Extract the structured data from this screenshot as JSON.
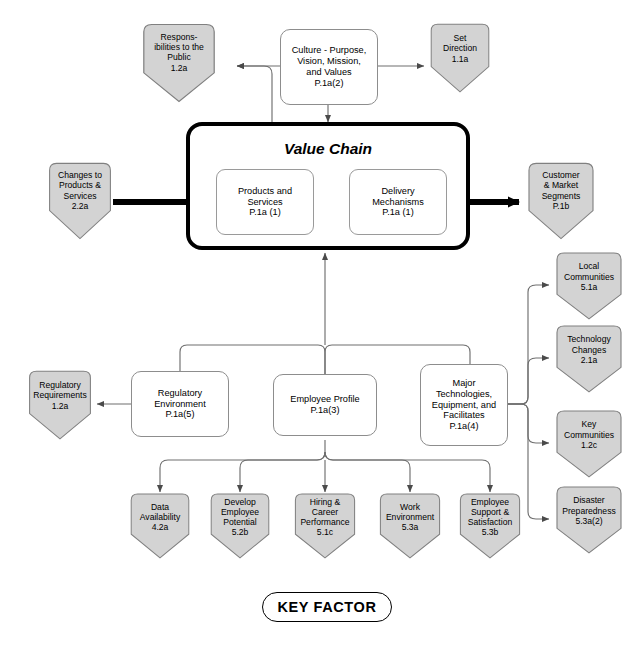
{
  "diagram": {
    "title": "Value Chain",
    "legend_label": "KEY FACTOR",
    "colors": {
      "pentagon_fill": "#d3d3d3",
      "pentagon_stroke": "#808080",
      "box_stroke": "#8d8d8d",
      "heavy_stroke": "#000000",
      "connector": "#6f6f6f",
      "background": "#ffffff"
    }
  },
  "value_chain": {
    "title": "Value Chain",
    "steps": [
      {
        "id": "products-and-services",
        "label": "Products and\nServices\nP.1a (1)"
      },
      {
        "id": "delivery-mechanisms",
        "label": "Delivery\nMechanisms\nP.1a (1)"
      }
    ]
  },
  "process_boxes": [
    {
      "id": "culture",
      "label": "Culture - Purpose,\nVision, Mission,\nand Values\nP.1a(2)"
    },
    {
      "id": "regulatory-environment",
      "label": "Regulatory\nEnvironment\nP.1a(5)"
    },
    {
      "id": "employee-profile",
      "label": "Employee Profile\nP.1a(3)"
    },
    {
      "id": "major-technologies",
      "label": "Major\nTechnologies,\nEquipment, and\nFacilitates\nP.1a(4)"
    }
  ],
  "key_factors": [
    {
      "id": "responsibilities-to-the-public",
      "label": "Respons-\nibilities to the\nPublic\n1.2a"
    },
    {
      "id": "set-direction",
      "label": "Set\nDirection\n1.1a"
    },
    {
      "id": "changes-to-products-and-services",
      "label": "Changes to\nProducts &\nServices\n2.2a"
    },
    {
      "id": "customer-and-market-segments",
      "label": "Customer\n& Market\nSegments\nP.1b"
    },
    {
      "id": "local-communities",
      "label": "Local\nCommunities\n5.1a"
    },
    {
      "id": "technology-changes",
      "label": "Technology\nChanges\n2.1a"
    },
    {
      "id": "key-communities",
      "label": "Key\nCommunities\n1.2c"
    },
    {
      "id": "disaster-preparedness",
      "label": "Disaster\nPreparedness\n5.3a(2)"
    },
    {
      "id": "regulatory-requirements",
      "label": "Regulatory\nRequirements\n1.2a"
    },
    {
      "id": "data-availability",
      "label": "Data\nAvailability\n4.2a"
    },
    {
      "id": "develop-employee-potential",
      "label": "Develop\nEmployee\nPotential\n5.2b"
    },
    {
      "id": "hiring-and-career-performance",
      "label": "Hiring &\nCareer\nPerformance\n5.1c"
    },
    {
      "id": "work-environment",
      "label": "Work\nEnvironment\n5.3a"
    },
    {
      "id": "employee-support-and-satisfaction",
      "label": "Employee\nSupport &\nSatisfaction\n5.3b"
    }
  ]
}
